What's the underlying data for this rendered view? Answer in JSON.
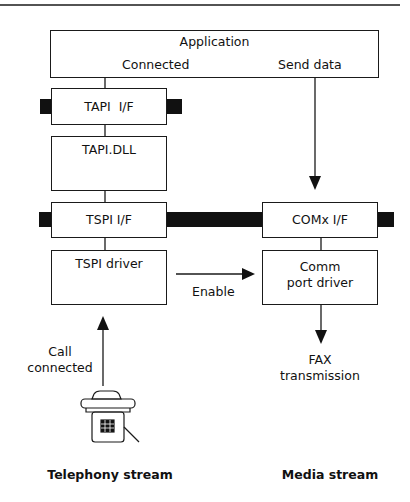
{
  "diagram": {
    "application": {
      "title": "Application",
      "connected": "Connected",
      "send_data": "Send data"
    },
    "telephony_stack": {
      "tapi_if": "TAPI  I/F",
      "tapi_dll": "TAPI.DLL",
      "tspi_if": "TSPI I/F",
      "tspi_driver": "TSPI driver"
    },
    "media_stack": {
      "comx_if": "COMx I/F",
      "comm_line1": "Comm",
      "comm_line2": "port driver"
    },
    "arrows": {
      "enable": "Enable",
      "call_line1": "Call",
      "call_line2": "connected",
      "fax_line1": "FAX",
      "fax_line2": "transmission"
    },
    "captions": {
      "telephony": "Telephony stream",
      "media": "Media stream"
    },
    "icons": {
      "phone": "telephone-icon"
    },
    "colors": {
      "line": "#1a1a1a",
      "background": "#ffffff"
    }
  }
}
